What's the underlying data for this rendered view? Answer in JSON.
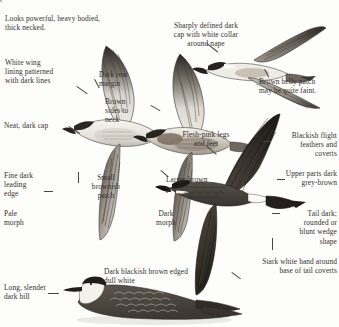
{
  "plate": {
    "title": "Skua / jaeger identification plate",
    "background_color": "#fdfdfc",
    "text_color": "#332f2c",
    "line_color": "#4a4440",
    "width": 339,
    "height": 327
  },
  "topbox": {
    "label": "",
    "x": 243,
    "y": 1,
    "w": 93,
    "h": 9
  },
  "annotations": [
    {
      "id": "powerful-build",
      "text": "Looks powerful, heavy bodied,\nthick necked.",
      "x": 5,
      "y": 14,
      "w": 125,
      "align": "left"
    },
    {
      "id": "white-wing-lining",
      "text": "White wing\nlining patterned\nwith dark lines",
      "x": 5,
      "y": 58,
      "w": 70,
      "align": "left"
    },
    {
      "id": "neat-dark-cap",
      "text": "Neat, dark cap",
      "x": 4,
      "y": 121,
      "w": 62,
      "align": "left"
    },
    {
      "id": "fine-dark-leading-edge",
      "text": "Fine dark\nleading\nedge",
      "x": 4,
      "y": 171,
      "w": 44,
      "align": "left"
    },
    {
      "id": "pale-morph",
      "text": "Pale\nmorph",
      "x": 4,
      "y": 209,
      "w": 42,
      "align": "left"
    },
    {
      "id": "long-slender-dark-bill",
      "text": "Long, slender\ndark bill",
      "x": 4,
      "y": 283,
      "w": 62,
      "align": "left"
    },
    {
      "id": "dark-rear-margin",
      "text": "Dark rear\nmargin",
      "x": 99,
      "y": 70,
      "w": 52,
      "align": "left"
    },
    {
      "id": "brown-sides-to-neck",
      "text": "Brown\nsides to\nneck",
      "x": 105,
      "y": 97,
      "w": 44,
      "align": "left"
    },
    {
      "id": "small-brownish-patch",
      "text": "Small\nbrownish\npatch",
      "x": 82,
      "y": 173,
      "w": 48,
      "align": "left"
    },
    {
      "id": "dark-morph",
      "text": "Dark\nmorph",
      "x": 148,
      "y": 209,
      "w": 42,
      "align": "left"
    },
    {
      "id": "larger-brown-patch",
      "text": "Larger brown\npatch",
      "x": 166,
      "y": 175,
      "w": 62,
      "align": "left"
    },
    {
      "id": "dark-blackish-brown-edged",
      "text": "Dark blackish brown edged\ndull white",
      "x": 104,
      "y": 267,
      "w": 124,
      "align": "left"
    },
    {
      "id": "sharply-defined-dark-cap",
      "text": "Sharply defined dark\ncap with white collar\naround nape",
      "x": 164,
      "y": 21,
      "w": 86,
      "align": "left"
    },
    {
      "id": "brown-belly-patch",
      "text": "Brown belly patch\nmay be quite faint.",
      "x": 261,
      "y": 77,
      "w": 76,
      "align": "left"
    },
    {
      "id": "flesh-pink-legs",
      "text": "Flesh-pink legs\nand feet",
      "x": 175,
      "y": 130,
      "w": 64,
      "align": "left"
    },
    {
      "id": "blackish-flight-feathers",
      "text": "Blackish flight\nfeathers and\ncoverts",
      "x": 263,
      "y": 131,
      "w": 74,
      "align": "right"
    },
    {
      "id": "upper-parts-dark",
      "text": "Upper parts dark\ngrey-brown",
      "x": 263,
      "y": 169,
      "w": 74,
      "align": "right"
    },
    {
      "id": "tail-dark-wedge",
      "text": "Tail dark;\nrounded or\nblunt wedge\nshape",
      "x": 272,
      "y": 209,
      "w": 65,
      "align": "right"
    },
    {
      "id": "stark-white-band",
      "text": "Stark white band around\nbase of tail coverts",
      "x": 227,
      "y": 257,
      "w": 110,
      "align": "right"
    }
  ],
  "leaders": [
    {
      "id": "lead-white-wing-lining",
      "x": 77,
      "y": 86,
      "len": 12,
      "angle": 35
    },
    {
      "id": "lead-neat-dark-cap",
      "x": 69,
      "y": 126,
      "len": 12,
      "angle": 33
    },
    {
      "id": "lead-dark-rear-margin",
      "x": 95,
      "y": 78,
      "len": 10,
      "angle": 62
    },
    {
      "id": "lead-brown-sides",
      "x": 151,
      "y": 104,
      "len": 11,
      "angle": 30
    },
    {
      "id": "lead-sharply-defined-cap",
      "x": 206,
      "y": 42,
      "len": 13,
      "angle": 38
    },
    {
      "id": "lead-brown-belly",
      "x": 264,
      "y": 70,
      "len": 9,
      "angle": 62
    },
    {
      "id": "lead-flesh-pink-legs",
      "x": 205,
      "y": 144,
      "len": 13,
      "angle": 40
    },
    {
      "id": "lead-larger-brown-patch",
      "x": 160,
      "y": 170,
      "len": 10,
      "angle": 40
    },
    {
      "id": "lead-dark-blackish",
      "x": 231,
      "y": 272,
      "len": 11,
      "angle": 36
    }
  ],
  "dashes": [
    {
      "id": "dash-leading-edge",
      "x": 44,
      "y": 190,
      "len": 9
    },
    {
      "id": "dash-long-bill",
      "x": 47,
      "y": 292,
      "len": 11
    },
    {
      "id": "dash-blackish-flight",
      "x": 263,
      "y": 141,
      "len": 9
    },
    {
      "id": "dash-upper-parts",
      "x": 278,
      "y": 179,
      "len": 9
    },
    {
      "id": "dash-tail-dark",
      "x": 272,
      "y": 213,
      "len": 9
    }
  ],
  "vbars": [
    {
      "id": "vbar-small-patch",
      "x": 78,
      "y": 172,
      "len": 11
    },
    {
      "id": "vbar-stark-white-band",
      "x": 272,
      "y": 238,
      "len": 12
    }
  ],
  "birds": [
    {
      "id": "bird-pale-morph-underside-left",
      "name": "pale-morph-flying-underside"
    },
    {
      "id": "bird-dark-belly-patch-middle",
      "name": "intermediate-morph-flying-underside"
    },
    {
      "id": "bird-pale-morph-upperside-right",
      "name": "pale-morph-flying-from-above"
    },
    {
      "id": "bird-dark-morph-flying",
      "name": "dark-morph-flying-upperside"
    },
    {
      "id": "bird-swimming",
      "name": "skua-swimming-on-water"
    }
  ]
}
